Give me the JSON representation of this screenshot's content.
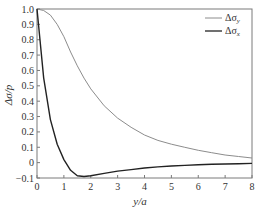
{
  "chart_data": {
    "type": "line",
    "title": "",
    "xlabel": "y/a",
    "ylabel": "Δσ/p",
    "xlim": [
      0,
      8
    ],
    "ylim": [
      -0.1,
      1.0
    ],
    "xticks": [
      "0",
      "1",
      "2",
      "3",
      "4",
      "5",
      "6",
      "7",
      "8"
    ],
    "yticks": [
      "−0.1",
      "0",
      "0.1",
      "0.2",
      "0.3",
      "0.4",
      "0.5",
      "0.6",
      "0.7",
      "0.8",
      "0.9",
      "1.0"
    ],
    "grid": false,
    "legend_position": "upper right",
    "x": [
      0,
      0.25,
      0.5,
      0.75,
      1.0,
      1.25,
      1.5,
      1.75,
      2.0,
      2.5,
      3.0,
      3.5,
      4.0,
      4.5,
      5.0,
      5.5,
      6.0,
      6.5,
      7.0,
      7.5,
      8.0
    ],
    "series": [
      {
        "name": "Δσy",
        "color": "#8c8c8c",
        "values": [
          1.0,
          0.99,
          0.96,
          0.9,
          0.82,
          0.72,
          0.63,
          0.55,
          0.48,
          0.37,
          0.29,
          0.23,
          0.18,
          0.145,
          0.12,
          0.1,
          0.08,
          0.065,
          0.05,
          0.04,
          0.03
        ]
      },
      {
        "name": "Δσx",
        "color": "#222222",
        "values": [
          1.0,
          0.55,
          0.28,
          0.12,
          0.02,
          -0.05,
          -0.085,
          -0.09,
          -0.085,
          -0.07,
          -0.055,
          -0.045,
          -0.035,
          -0.028,
          -0.022,
          -0.018,
          -0.014,
          -0.011,
          -0.009,
          -0.007,
          -0.005
        ]
      }
    ]
  },
  "legend": {
    "items": [
      {
        "label": "Δσ",
        "sub": "y"
      },
      {
        "label": "Δσ",
        "sub": "x"
      }
    ]
  },
  "axes": {
    "xlabel": "y/a",
    "ylabel": "Δσ/p"
  }
}
